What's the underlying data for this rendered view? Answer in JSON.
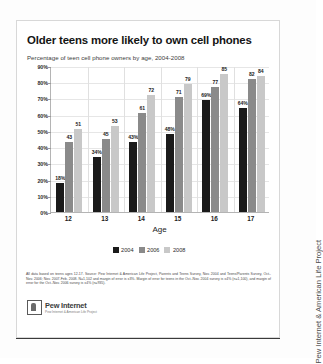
{
  "title": "Older teens more likely to own cell phones",
  "subtitle": "Percentage of teen cell phone owners by age, 2004-2008",
  "axis": {
    "x_title": "Age",
    "y_ticks": [
      "0%",
      "10%",
      "20%",
      "30%",
      "40%",
      "50%",
      "60%",
      "70%",
      "80%",
      "90%"
    ]
  },
  "legend": {
    "items": [
      {
        "label": "2004",
        "color": "#1a1a1a"
      },
      {
        "label": "2006",
        "color": "#8a8a8a"
      },
      {
        "label": "2008",
        "color": "#c8c8c8"
      }
    ]
  },
  "bar_labels": {
    "g0": [
      "18%",
      "43",
      "51"
    ],
    "g1": [
      "34%",
      "45",
      "53"
    ],
    "g2": [
      "43%",
      "61",
      "72"
    ],
    "g3": [
      "48%",
      "71",
      "79"
    ],
    "g4": [
      "69%",
      "77",
      "85"
    ],
    "g5": [
      "64%",
      "82",
      "84"
    ]
  },
  "footnote": "All data based on teens ages 12-17.  Source: Pew Internet & American Life Project, Parents and Teens Survey, Nov. 2004 and Teens/Parents Survey, Oct.-Nov. 2006; Nov. 2007-Feb. 2008.  N=1,102 and margin of error is ±3%. Margin of error for teens in the Oct.-Nov. 2004 survey is ±4% (n=1,100), and margin of error for the Oct.-Nov. 2006 survey is ±4% (n=935).",
  "logo": {
    "name": "Pew Internet",
    "tagline": "Pew Internet & American Life Project"
  },
  "side_credit": "Pew Internet & American Life Project",
  "chart_data": {
    "type": "bar",
    "title": "Older teens more likely to own cell phones",
    "subtitle": "Percentage of teen cell phone owners by age, 2004-2008",
    "xlabel": "Age",
    "ylabel": "",
    "ylim": [
      0,
      90
    ],
    "ytick_step": 10,
    "grid": true,
    "legend_position": "bottom",
    "categories": [
      "12",
      "13",
      "14",
      "15",
      "16",
      "17"
    ],
    "series": [
      {
        "name": "2004",
        "color": "#1a1a1a",
        "values": [
          18,
          34,
          43,
          48,
          69,
          64
        ]
      },
      {
        "name": "2006",
        "color": "#8a8a8a",
        "values": [
          43,
          45,
          61,
          71,
          77,
          82
        ]
      },
      {
        "name": "2008",
        "color": "#c8c8c8",
        "values": [
          51,
          53,
          72,
          79,
          85,
          84
        ]
      }
    ]
  }
}
